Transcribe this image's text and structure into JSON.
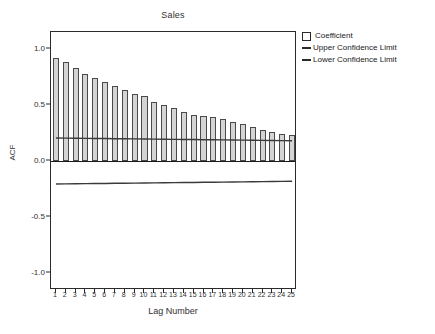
{
  "chart_data": {
    "type": "bar",
    "title": "Sales",
    "xlabel": "Lag Number",
    "ylabel": "ACF",
    "ylim": [
      -1.15,
      1.15
    ],
    "yticks": [
      "1.0",
      "0.5",
      "0.0",
      "-0.5",
      "-1.0"
    ],
    "ytick_values": [
      1.0,
      0.5,
      0.0,
      -0.5,
      -1.0
    ],
    "grid": false,
    "legend_position": "top-right",
    "categories": [
      1,
      2,
      3,
      4,
      5,
      6,
      7,
      8,
      9,
      10,
      11,
      12,
      13,
      14,
      15,
      16,
      17,
      18,
      19,
      20,
      21,
      22,
      23,
      24,
      25
    ],
    "series": [
      {
        "name": "Coefficient",
        "values": [
          0.92,
          0.88,
          0.83,
          0.78,
          0.74,
          0.7,
          0.67,
          0.63,
          0.6,
          0.58,
          0.53,
          0.5,
          0.47,
          0.44,
          0.41,
          0.4,
          0.39,
          0.37,
          0.35,
          0.33,
          0.3,
          0.28,
          0.26,
          0.24,
          0.23
        ]
      },
      {
        "name": "Upper Confidence Limit",
        "values": [
          0.205,
          0.204,
          0.203,
          0.202,
          0.201,
          0.2,
          0.199,
          0.198,
          0.197,
          0.196,
          0.195,
          0.194,
          0.193,
          0.192,
          0.191,
          0.19,
          0.189,
          0.188,
          0.187,
          0.186,
          0.185,
          0.184,
          0.183,
          0.182,
          0.181
        ]
      },
      {
        "name": "Lower Confidence Limit",
        "values": [
          -0.205,
          -0.204,
          -0.203,
          -0.202,
          -0.201,
          -0.2,
          -0.199,
          -0.198,
          -0.197,
          -0.196,
          -0.195,
          -0.194,
          -0.193,
          -0.192,
          -0.191,
          -0.19,
          -0.189,
          -0.188,
          -0.187,
          -0.186,
          -0.185,
          -0.184,
          -0.183,
          -0.182,
          -0.181
        ]
      }
    ]
  },
  "legend": {
    "items": [
      {
        "label": "Coefficient",
        "marker": "square-swatch",
        "color": "#d4d4d4"
      },
      {
        "label": "Upper Confidence Limit",
        "marker": "line-swatch",
        "color": "#2a2a2a"
      },
      {
        "label": "Lower Confidence Limit",
        "marker": "line-swatch",
        "color": "#2a2a2a"
      }
    ]
  },
  "colors": {
    "bar_fill": "#d4d4d4",
    "bar_stroke": "#4a4a4a",
    "axis": "#2a2a2a",
    "confidence_line": "#3a3a3a",
    "text": "#303030"
  }
}
